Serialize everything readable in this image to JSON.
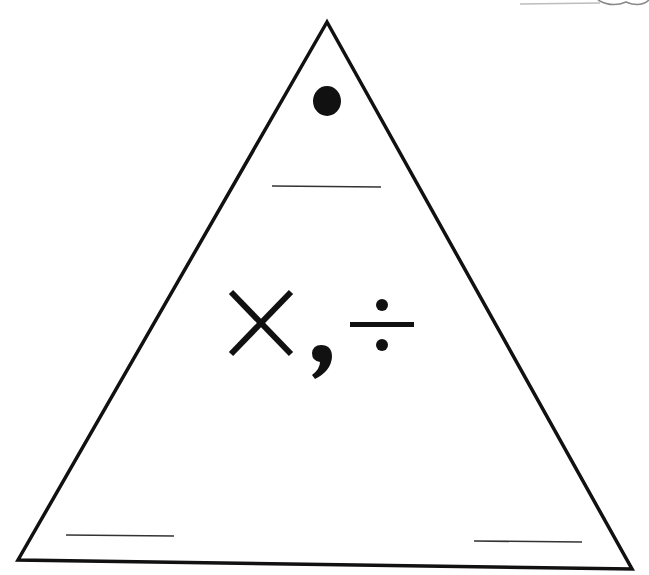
{
  "diagram": {
    "center_label": "×, ÷",
    "symbols": [
      "×",
      ",",
      "÷"
    ],
    "colors": {
      "stroke": "#111111",
      "background": "#ffffff",
      "blank_line": "#333333"
    },
    "triangle": {
      "apex": [
        327,
        22
      ],
      "bottom_left": [
        18,
        560
      ],
      "bottom_right": [
        632,
        569
      ]
    },
    "top_marker": "filled-dot",
    "blanks": [
      {
        "position": "top",
        "label": ""
      },
      {
        "position": "bottom-left",
        "label": ""
      },
      {
        "position": "bottom-right",
        "label": ""
      }
    ]
  }
}
